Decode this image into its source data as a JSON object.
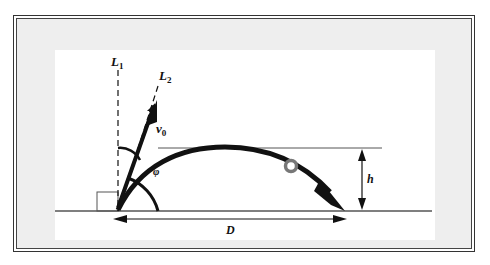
{
  "diagram": {
    "labels": {
      "L1": "L",
      "L1_sub": "1",
      "L2": "L",
      "L2_sub": "2",
      "v0": "v",
      "v0_sub": "0",
      "phi": "φ",
      "h": "h",
      "D": "D"
    },
    "colors": {
      "frame": "#333333",
      "frame_fill": "#eeeeee",
      "panel": "#ffffff",
      "ink": "#111111",
      "ball_stroke": "#777777",
      "guide_line": "#555555"
    },
    "elements": [
      "vertical dashed line L1",
      "inclined dashed line L2",
      "initial velocity arrow v0",
      "parabolic trajectory arrow",
      "ball on trajectory",
      "angle arc phi",
      "angle arc between L1 and v0",
      "right-angle marker",
      "ground line",
      "height marker h",
      "horizontal distance marker D"
    ]
  }
}
